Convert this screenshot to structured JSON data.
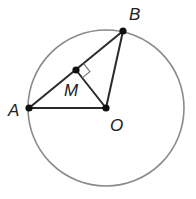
{
  "diagram": {
    "points": {
      "A": {
        "label": "A"
      },
      "B": {
        "label": "B"
      },
      "M": {
        "label": "M"
      },
      "O": {
        "label": "O"
      }
    },
    "colors": {
      "circle": "#8a8a8a",
      "lines": "#2a2a2a",
      "points": "#111111"
    }
  }
}
